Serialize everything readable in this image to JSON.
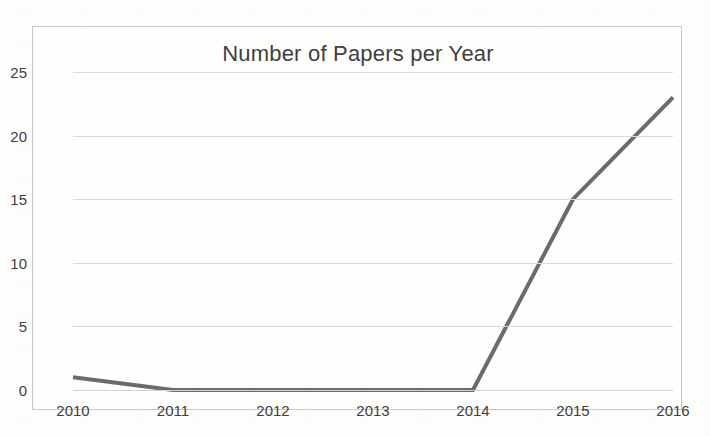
{
  "chart": {
    "title": "Number of Papers per Year",
    "frame_border_color": "#c9c9c9",
    "gridline_color": "#dadada",
    "line_color": "#6b6b6b",
    "text_color": "#404040",
    "background_color": "#fdfdfc"
  },
  "chart_data": {
    "type": "line",
    "title": "Number of Papers per Year",
    "xlabel": "",
    "ylabel": "",
    "categories": [
      "2010",
      "2011",
      "2012",
      "2013",
      "2014",
      "2015",
      "2016"
    ],
    "x": [
      2010,
      2011,
      2012,
      2013,
      2014,
      2015,
      2016
    ],
    "values": [
      1,
      0,
      0,
      0,
      0,
      15,
      23
    ],
    "series": [
      {
        "name": "Number of Papers",
        "values": [
          1,
          0,
          0,
          0,
          0,
          15,
          23
        ],
        "color": "#6b6b6b"
      }
    ],
    "ylim": [
      0,
      25
    ],
    "yticks": [
      0,
      5,
      10,
      15,
      20,
      25
    ],
    "ytick_labels": [
      "0",
      "5",
      "10",
      "15",
      "20",
      "25"
    ],
    "xtick_labels": [
      "2010",
      "2011",
      "2012",
      "2013",
      "2014",
      "2015",
      "2016"
    ],
    "grid": true,
    "grid_axis": "y",
    "legend": false,
    "legend_position": "none",
    "markers": false,
    "line_width": 4
  }
}
